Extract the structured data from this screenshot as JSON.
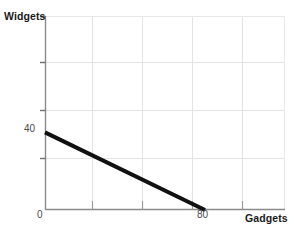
{
  "chart_data": {
    "type": "line",
    "title": "",
    "subtitle": "",
    "xlabel": "Gadgets",
    "ylabel": "Widgets",
    "xlim": [
      0,
      120
    ],
    "ylim": [
      0,
      100
    ],
    "grid": true,
    "legend": null,
    "legend_position": "none",
    "xticks": [
      {
        "value": 0,
        "label": "0"
      },
      {
        "value": 80,
        "label": "80"
      }
    ],
    "yticks": [
      {
        "value": 40,
        "label": "40"
      }
    ],
    "gridlines": {
      "vertical_values": [
        24,
        48,
        72,
        96,
        120
      ],
      "horizontal_values": [
        75,
        50,
        25
      ]
    },
    "series": [
      {
        "name": "Production possibilities frontier",
        "color": "#111111",
        "line_width": 4,
        "points": [
          {
            "x": 0,
            "y": 40
          },
          {
            "x": 80,
            "y": 0
          }
        ]
      }
    ],
    "annotations": []
  },
  "figure": {
    "axis_color": "#8a8a8a",
    "grid_color": "#e3e3e3",
    "background": "#ffffff",
    "tick_label_color": "#4a4a4a",
    "axis_title_color": "#1a1a1a"
  }
}
